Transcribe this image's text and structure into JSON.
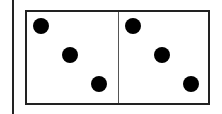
{
  "figure": {
    "type": "domino",
    "colors": {
      "outline": "#222222",
      "pip": "#000000",
      "background": "#ffffff",
      "divider": "#555555"
    },
    "halves": [
      {
        "side": "left",
        "value": 3,
        "pips": [
          {
            "x": 6,
            "y": 6
          },
          {
            "x": 35,
            "y": 35
          },
          {
            "x": 64,
            "y": 64
          }
        ]
      },
      {
        "side": "right",
        "value": 3,
        "pips": [
          {
            "x": 6,
            "y": 6
          },
          {
            "x": 35,
            "y": 35
          },
          {
            "x": 64,
            "y": 64
          }
        ]
      }
    ]
  }
}
